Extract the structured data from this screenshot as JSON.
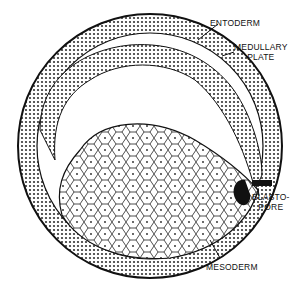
{
  "figure": {
    "labels": {
      "entoderm": "ENTODERM",
      "medullary_plate_line1": "MEDULLARY",
      "medullary_plate_line2": "PLATE",
      "blastopore_line1": "BLASTO-",
      "blastopore_line2": "PORE",
      "mesoderm": "MESODERM"
    }
  }
}
